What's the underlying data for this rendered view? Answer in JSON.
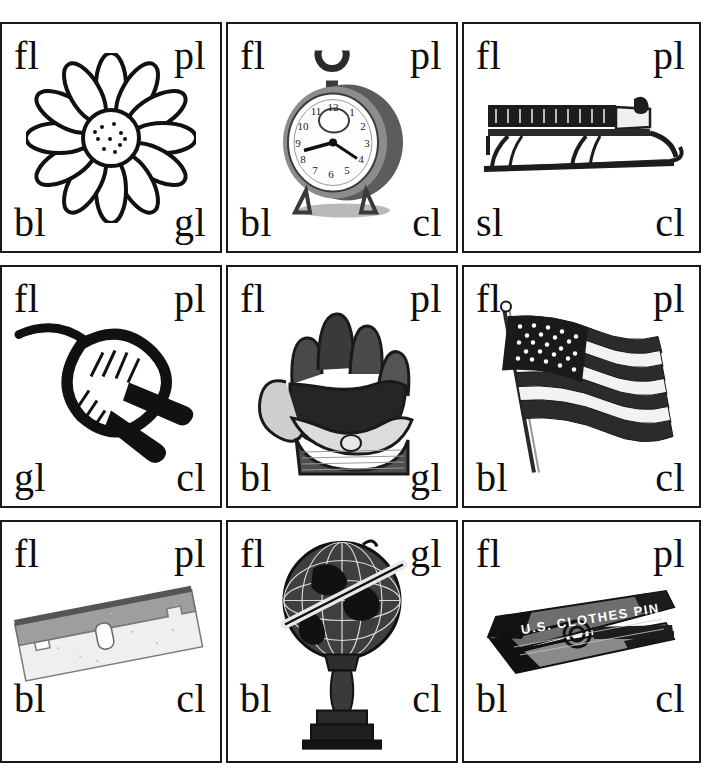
{
  "worksheet": {
    "title": "Initial L-Blends Picture Cards",
    "columns": 3,
    "rows": 3,
    "ink_color": "#111111",
    "background_color": "#ffffff",
    "border_color": "#1a1a1a"
  },
  "cells": [
    {
      "id": "cell-1",
      "picture": "flower",
      "picture_icon": "flower-icon",
      "labels": {
        "top_left": "fl",
        "top_right": "pl",
        "bottom_left": "bl",
        "bottom_right": "gl"
      }
    },
    {
      "id": "cell-2",
      "picture": "clock",
      "picture_icon": "alarm-clock-icon",
      "labels": {
        "top_left": "fl",
        "top_right": "pl",
        "bottom_left": "bl",
        "bottom_right": "cl"
      }
    },
    {
      "id": "cell-3",
      "picture": "sled",
      "picture_icon": "sled-icon",
      "labels": {
        "top_left": "fl",
        "top_right": "pl",
        "bottom_left": "sl",
        "bottom_right": "cl"
      }
    },
    {
      "id": "cell-4",
      "picture": "plug",
      "picture_icon": "electric-plug-icon",
      "labels": {
        "top_left": "fl",
        "top_right": "pl",
        "bottom_left": "gl",
        "bottom_right": "cl"
      }
    },
    {
      "id": "cell-5",
      "picture": "glove",
      "picture_icon": "baseball-glove-icon",
      "labels": {
        "top_left": "fl",
        "top_right": "pl",
        "bottom_left": "bl",
        "bottom_right": "gl"
      }
    },
    {
      "id": "cell-6",
      "picture": "flag",
      "picture_icon": "american-flag-icon",
      "labels": {
        "top_left": "fl",
        "top_right": "pl",
        "bottom_left": "bl",
        "bottom_right": "cl"
      }
    },
    {
      "id": "cell-7",
      "picture": "blade",
      "picture_icon": "razor-blade-icon",
      "labels": {
        "top_left": "fl",
        "top_right": "pl",
        "bottom_left": "bl",
        "bottom_right": "cl"
      }
    },
    {
      "id": "cell-8",
      "picture": "globe",
      "picture_icon": "globe-icon",
      "labels": {
        "top_left": "fl",
        "top_right": "gl",
        "bottom_left": "bl",
        "bottom_right": "cl"
      }
    },
    {
      "id": "cell-9",
      "picture": "clothespin",
      "picture_icon": "clothespin-icon",
      "picture_caption": "U.S. CLOTHES PIN",
      "labels": {
        "top_left": "fl",
        "top_right": "pl",
        "bottom_left": "bl",
        "bottom_right": "cl"
      }
    }
  ]
}
